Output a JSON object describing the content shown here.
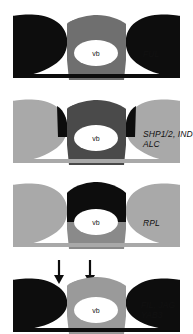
{
  "figure": {
    "title": "",
    "background_color": "#ffffff",
    "width": 193,
    "height": 334,
    "colors": {
      "black": "#0d0d0d",
      "gray": "#a9a9a9",
      "dark_gray": "#4a4a4a",
      "white": "#ffffff",
      "text": "#111111"
    },
    "center_label": "vb"
  },
  "panels": [
    {
      "id": "panel-ful",
      "label": "FUL",
      "label_lines": [
        "FUL"
      ],
      "wing_color": "#0d0d0d",
      "stalk_color": "#6f6f6f",
      "cap_color": "#6f6f6f",
      "center_label": "vb",
      "has_arrows": false,
      "top": 8
    },
    {
      "id": "panel-shp",
      "label": "SHP1/2, IND\nALC",
      "label_lines": [
        "SHP1/2, IND",
        "ALC"
      ],
      "wing_color": "#a9a9a9",
      "stalk_color": "#4a4a4a",
      "cap_color": "#4a4a4a",
      "center_label": "vb",
      "has_arrows": false,
      "top": 93
    },
    {
      "id": "panel-rpl",
      "label": "RPL",
      "label_lines": [
        "RPL"
      ],
      "wing_color": "#a9a9a9",
      "stalk_color": "#8a8a8a",
      "cap_color": "#0d0d0d",
      "center_label": "vb",
      "has_arrows": false,
      "top": 177
    },
    {
      "id": "panel-fil",
      "label": "FIL, JAG\nYAB3",
      "label_lines": [
        "FIL, JAG",
        "YAB3"
      ],
      "wing_color": "#0d0d0d",
      "stalk_color": "#9a9a9a",
      "cap_color": "#9a9a9a",
      "center_label": "vb",
      "has_arrows": true,
      "arrow_count": 2,
      "top": 258
    }
  ]
}
